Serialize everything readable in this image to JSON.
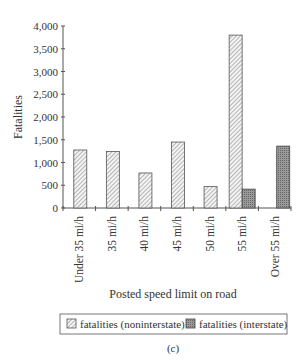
{
  "chart_data": {
    "type": "bar",
    "title": "",
    "xlabel": "Posted speed limit on road",
    "ylabel": "Fatalities",
    "ylim": [
      0,
      4000
    ],
    "yticks": [
      0,
      500,
      1000,
      1500,
      2000,
      2500,
      3000,
      3500,
      4000
    ],
    "ytick_labels": [
      "0",
      "500",
      "1,000",
      "1,500",
      "2,000",
      "2,500",
      "3,000",
      "3,500",
      "4,000"
    ],
    "categories": [
      "Under 35 mi/h",
      "35 mi/h",
      "40 mi/h",
      "45 mi/h",
      "50 mi/h",
      "55 mi/h",
      "Over 55 mi/h"
    ],
    "series": [
      {
        "name": "fatalities (noninterstate)",
        "values": [
          1275,
          1240,
          770,
          1450,
          470,
          3800,
          0
        ],
        "pattern": "hatched"
      },
      {
        "name": "fatalities (interstate)",
        "values": [
          0,
          0,
          0,
          0,
          0,
          415,
          1360
        ],
        "pattern": "dark-stipple"
      }
    ],
    "grid": false,
    "legend_position": "bottom",
    "caption": "(c)"
  }
}
